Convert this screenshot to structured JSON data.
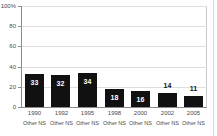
{
  "chart_data": {
    "type": "bar",
    "title": "",
    "subtitle": "",
    "xlabel": "",
    "ylabel": "",
    "ylim": [
      0,
      100
    ],
    "grid": true,
    "legend": null,
    "categories": [
      "1990",
      "1992",
      "1995",
      "1998",
      "2000",
      "2002",
      "2005"
    ],
    "category_sublabels": [
      "Other NS",
      "Other NS",
      "Other NS",
      "Other NS",
      "Other NS",
      "Other NS",
      "Other NS"
    ],
    "values": [
      33,
      32,
      34,
      18,
      16,
      14,
      11
    ],
    "value_label_position": [
      "inside",
      "inside",
      "inside",
      "inside",
      "inside",
      "above",
      "above"
    ],
    "series": [
      {
        "name": "Other NS",
        "values": [
          33,
          32,
          34,
          18,
          16,
          14,
          11
        ],
        "color": "#111111"
      }
    ],
    "yticks": [
      {
        "value": 100,
        "label": "100%"
      },
      {
        "value": 80,
        "label": "80"
      },
      {
        "value": 60,
        "label": "60"
      },
      {
        "value": 40,
        "label": "40"
      },
      {
        "value": 20,
        "label": "20"
      },
      {
        "value": 0,
        "label": "0"
      }
    ],
    "colors": {
      "bar": "#111111",
      "grid": "#dedede",
      "axis": "#8d8d8d",
      "frame": "#c9c9c9",
      "text": "#4a4a4a",
      "value_inside": "#ffffff",
      "value_above": "#111111",
      "background": "#ffffff"
    }
  }
}
